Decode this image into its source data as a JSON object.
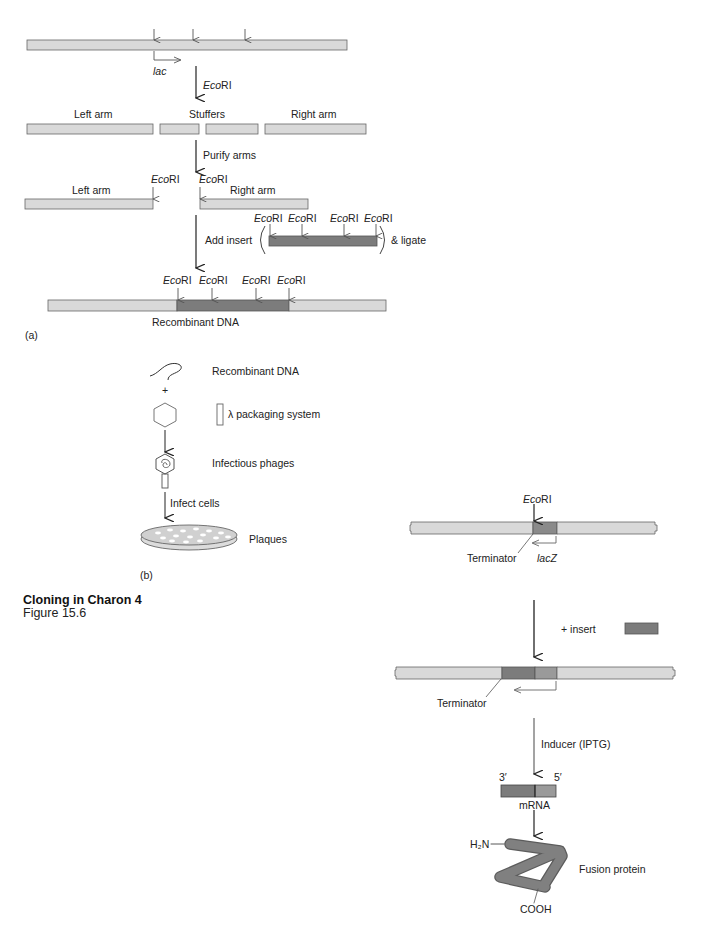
{
  "figure": {
    "title": "Cloning in Charon 4",
    "subtitle": "Figure 15.6",
    "bottom_caption_clipped": "Expression Fusion Protein in lambda gt11"
  },
  "colors": {
    "dna_light": "#d9d9d9",
    "insert_dark": "#7c7c7c",
    "lacz_mid": "#9a9a9a",
    "outline": "#555555",
    "arrow": "#222222"
  },
  "panel_a": {
    "label": "(a)",
    "promoter": "lac",
    "enzyme_prefix": "Eco",
    "enzyme_suffix": "RI",
    "step1_enzyme": "EcoRI",
    "left_arm": "Left arm",
    "stuffers": "Stuffers",
    "right_arm": "Right arm",
    "step2": "Purify arms",
    "left_arm_2": "Left arm",
    "right_arm_2": "Right arm",
    "step3": "Add insert",
    "ligate": "& ligate",
    "result": "Recombinant DNA"
  },
  "panel_b": {
    "label": "(b)",
    "recombinant": "Recombinant DNA",
    "plus": "+",
    "packaging": "λ packaging system",
    "phages": "Infectious phages",
    "infect": "Infect cells",
    "plaques": "Plaques"
  },
  "panel_c": {
    "enzyme": "EcoRI",
    "terminator": "Terminator",
    "lacz": "lacZ",
    "plus_insert": "+  insert",
    "terminator_2": "Terminator",
    "inducer": "Inducer (IPTG)",
    "three_prime": "3′",
    "five_prime": "5′",
    "mrna": "mRNA",
    "n_term": "H₂N",
    "c_term": "COOH",
    "protein": "Fusion protein"
  }
}
